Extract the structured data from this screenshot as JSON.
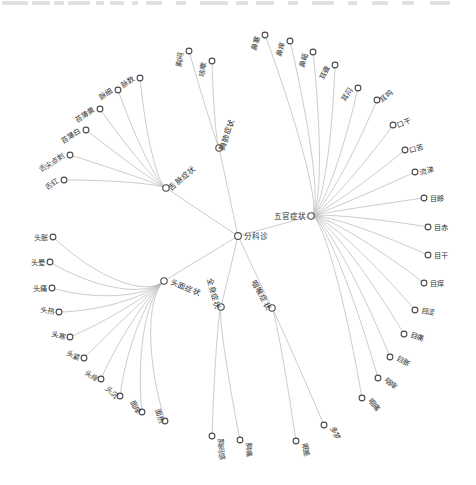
{
  "meta": {
    "background_color": "#ffffff",
    "link_color": "#b3b3b3",
    "node_stroke_color": "#4a4a4a",
    "label_color": "#333333",
    "width": 476,
    "height": 485
  },
  "chart_data": {
    "type": "tree",
    "layout": "radial",
    "center": [
      238,
      236
    ],
    "root": {
      "label": "分科诊",
      "x": 238,
      "y": 236
    },
    "branches": [
      {
        "label": "舌脉症状",
        "x": 166,
        "y": 188,
        "hub": [
          150,
          180
        ],
        "label_angle": -40,
        "label_anchor": "start",
        "children": [
          {
            "label": "舌红",
            "x": 64,
            "y": 180,
            "angle": -32,
            "anchor": "end"
          },
          {
            "label": "舌尖点刺",
            "x": 70,
            "y": 155,
            "angle": -32,
            "anchor": "end"
          },
          {
            "label": "苔薄白",
            "x": 86,
            "y": 130,
            "angle": -32,
            "anchor": "end"
          },
          {
            "label": "苔薄黄",
            "x": 100,
            "y": 109,
            "angle": -32,
            "anchor": "end"
          },
          {
            "label": "脉细",
            "x": 118,
            "y": 90,
            "angle": -32,
            "anchor": "end"
          },
          {
            "label": "脉数",
            "x": 140,
            "y": 78,
            "angle": -32,
            "anchor": "end"
          }
        ]
      },
      {
        "label": "胸肺症状",
        "x": 219,
        "y": 148,
        "hub": [
          214,
          138
        ],
        "label_angle": -72,
        "label_anchor": "start",
        "children": [
          {
            "label": "胸闷",
            "x": 189,
            "y": 51,
            "angle": -80,
            "anchor": "end"
          },
          {
            "label": "咳嗽",
            "x": 212,
            "y": 61,
            "angle": -80,
            "anchor": "end"
          }
        ]
      },
      {
        "label": "五官症状",
        "x": 311,
        "y": 216,
        "hub": [
          330,
          211
        ],
        "label_angle": 0,
        "label_anchor": "end",
        "children": [
          {
            "label": "鼻塞",
            "x": 265,
            "y": 35,
            "angle": -74,
            "anchor": "end"
          },
          {
            "label": "鼻痒",
            "x": 290,
            "y": 41,
            "angle": -74,
            "anchor": "end"
          },
          {
            "label": "鼻衄",
            "x": 313,
            "y": 52,
            "angle": -74,
            "anchor": "end"
          },
          {
            "label": "耳聋",
            "x": 335,
            "y": 65,
            "angle": -66,
            "anchor": "end"
          },
          {
            "label": "耳闷",
            "x": 358,
            "y": 88,
            "angle": -56,
            "anchor": "end"
          },
          {
            "label": "耳鸣",
            "x": 377,
            "y": 100,
            "angle": -40,
            "anchor": "start"
          },
          {
            "label": "口干",
            "x": 393,
            "y": 125,
            "angle": -22,
            "anchor": "start"
          },
          {
            "label": "口苦",
            "x": 405,
            "y": 150,
            "angle": -16,
            "anchor": "start"
          },
          {
            "label": "流涕",
            "x": 415,
            "y": 172,
            "angle": -10,
            "anchor": "start"
          },
          {
            "label": "目眵",
            "x": 424,
            "y": 198,
            "angle": 0,
            "anchor": "start"
          },
          {
            "label": "目赤",
            "x": 428,
            "y": 227,
            "angle": 0,
            "anchor": "start"
          },
          {
            "label": "目干",
            "x": 428,
            "y": 255,
            "angle": 0,
            "anchor": "start"
          },
          {
            "label": "目痒",
            "x": 424,
            "y": 283,
            "angle": 0,
            "anchor": "start"
          },
          {
            "label": "目涩",
            "x": 415,
            "y": 310,
            "angle": 10,
            "anchor": "start"
          },
          {
            "label": "目痛",
            "x": 404,
            "y": 334,
            "angle": 18,
            "anchor": "start"
          },
          {
            "label": "目胀",
            "x": 390,
            "y": 357,
            "angle": 28,
            "anchor": "start"
          },
          {
            "label": "咽痒",
            "x": 378,
            "y": 378,
            "angle": 40,
            "anchor": "start"
          },
          {
            "label": "咽痛",
            "x": 362,
            "y": 398,
            "angle": 52,
            "anchor": "start"
          }
        ]
      },
      {
        "label": "咽喉症状",
        "x": 272,
        "y": 308,
        "hub": [
          278,
          318
        ],
        "label_angle": 62,
        "label_anchor": "end",
        "children": [
          {
            "label": "多梦",
            "x": 324,
            "y": 425,
            "angle": 62,
            "anchor": "start"
          },
          {
            "label": "眠差",
            "x": 296,
            "y": 441,
            "angle": 76,
            "anchor": "start"
          }
        ]
      },
      {
        "label": "全身症状",
        "x": 221,
        "y": 307,
        "hub": [
          216,
          318
        ],
        "label_angle": 74,
        "label_anchor": "end",
        "children": [
          {
            "label": "胸痛",
            "x": 240,
            "y": 440,
            "angle": 82,
            "anchor": "start"
          },
          {
            "label": "胸闷感",
            "x": 212,
            "y": 436,
            "angle": 84,
            "anchor": "start"
          }
        ]
      },
      {
        "label": "头面症状",
        "x": 164,
        "y": 281,
        "hub": [
          131,
          311
        ],
        "label_angle": 22,
        "label_anchor": "start",
        "children": [
          {
            "label": "头胀",
            "x": 53,
            "y": 237,
            "angle": 0,
            "anchor": "end"
          },
          {
            "label": "头晕",
            "x": 50,
            "y": 262,
            "angle": 0,
            "anchor": "end"
          },
          {
            "label": "头痛",
            "x": 52,
            "y": 288,
            "angle": 0,
            "anchor": "end"
          },
          {
            "label": "头热",
            "x": 59,
            "y": 312,
            "angle": 10,
            "anchor": "end"
          },
          {
            "label": "头寒",
            "x": 70,
            "y": 337,
            "angle": 16,
            "anchor": "end"
          },
          {
            "label": "头紧",
            "x": 84,
            "y": 358,
            "angle": 22,
            "anchor": "end"
          },
          {
            "label": "头痒",
            "x": 101,
            "y": 379,
            "angle": 34,
            "anchor": "end"
          },
          {
            "label": "头沉",
            "x": 120,
            "y": 396,
            "angle": 46,
            "anchor": "end"
          },
          {
            "label": "面痒",
            "x": 142,
            "y": 412,
            "angle": 62,
            "anchor": "end"
          },
          {
            "label": "面热",
            "x": 165,
            "y": 421,
            "angle": 70,
            "anchor": "end"
          }
        ]
      }
    ]
  }
}
